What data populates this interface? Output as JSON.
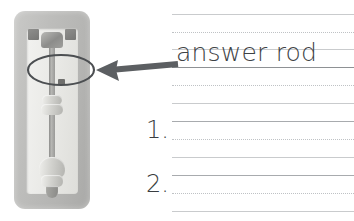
{
  "worksheet": {
    "vocabulary_word": "answer rod",
    "prompts": [
      {
        "number": "1."
      },
      {
        "number": "2."
      }
    ],
    "rule_lines": [
      {
        "y": 14,
        "style": "solid"
      },
      {
        "y": 32,
        "style": "dotted"
      },
      {
        "y": 49,
        "style": "solid"
      },
      {
        "y": 67,
        "style": "baseline"
      },
      {
        "y": 85,
        "style": "dotted"
      },
      {
        "y": 103,
        "style": "solid"
      },
      {
        "y": 121,
        "style": "solid"
      },
      {
        "y": 139,
        "style": "dotted"
      },
      {
        "y": 157,
        "style": "solid"
      },
      {
        "y": 175,
        "style": "solid"
      },
      {
        "y": 193,
        "style": "dotted"
      },
      {
        "y": 211,
        "style": "solid"
      }
    ]
  },
  "illustration": {
    "subject": "answer-rod-device-photo",
    "caption_target": "answer rod",
    "annotation": {
      "ellipse": {
        "label": "highlight-ellipse",
        "cx": 61,
        "cy": 70,
        "rx": 33,
        "ry": 15
      },
      "arrow": {
        "label": "pointer-arrow",
        "direction": "left",
        "from_x": 178,
        "to_x": 98,
        "y": 70
      }
    },
    "parts": [
      {
        "name": "plastic-carrier-frame"
      },
      {
        "name": "inner-window"
      },
      {
        "name": "mounting-lug-left"
      },
      {
        "name": "mounting-lug-right"
      },
      {
        "name": "rod-hub"
      },
      {
        "name": "rod-shaft"
      },
      {
        "name": "rod-collar-upper"
      },
      {
        "name": "rod-collar-lower"
      },
      {
        "name": "rod-bulb"
      },
      {
        "name": "rod-tip"
      }
    ]
  },
  "colors": {
    "page_background": "#ffffff",
    "word_text": "#3e4245",
    "number_text": "#3a3d40",
    "rule_solid": "#c9cbcd",
    "rule_dotted": "#bfc2c5",
    "rule_baseline": "#8e9194",
    "annotation_stroke": "#4c4f52",
    "device_frame": "#bdbdbb",
    "device_window": "#eceae7",
    "device_metal": "#8f8f8d"
  }
}
